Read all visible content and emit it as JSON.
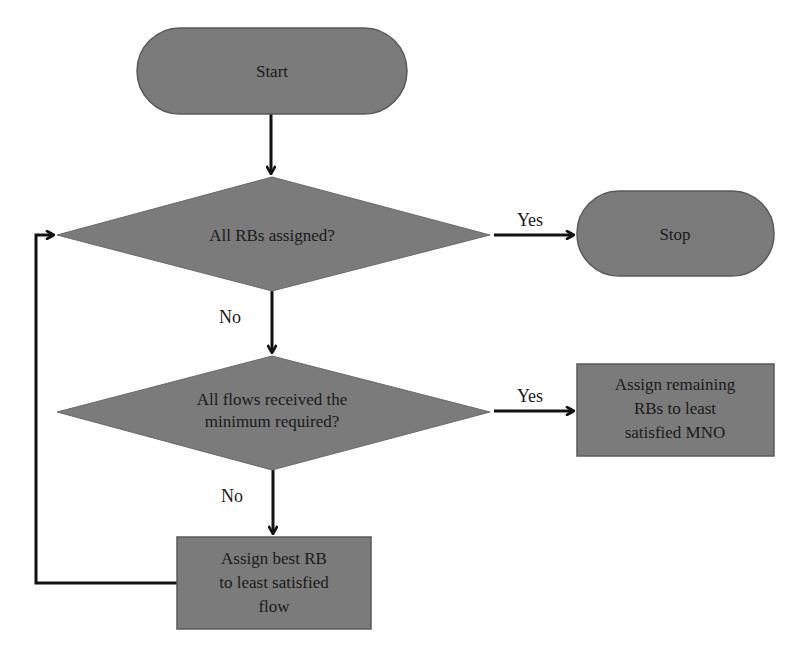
{
  "diagram": {
    "type": "flowchart",
    "colors": {
      "node_fill": "#7b7b7b",
      "node_border": "#5a5a5a",
      "edge": "#111111",
      "text": "#1a1a1a"
    },
    "nodes": {
      "start": {
        "shape": "terminator",
        "label": "Start"
      },
      "decision_rbs": {
        "shape": "decision",
        "label": "All RBs assigned?"
      },
      "stop": {
        "shape": "terminator",
        "label": "Stop"
      },
      "decision_flows": {
        "shape": "decision",
        "lines": [
          "All flows received the",
          "minimum required?"
        ]
      },
      "assign_remaining": {
        "shape": "process",
        "lines": [
          "Assign remaining",
          "RBs to least",
          "satisfied MNO"
        ]
      },
      "assign_best": {
        "shape": "process",
        "lines": [
          "Assign best RB",
          "to least satisfied",
          "flow"
        ]
      }
    },
    "edges": {
      "start_to_rbs": {
        "from": "start",
        "to": "decision_rbs",
        "label": ""
      },
      "rbs_yes": {
        "from": "decision_rbs",
        "to": "stop",
        "label": "Yes"
      },
      "rbs_no": {
        "from": "decision_rbs",
        "to": "decision_flows",
        "label": "No"
      },
      "flows_yes": {
        "from": "decision_flows",
        "to": "assign_remaining",
        "label": "Yes"
      },
      "flows_no": {
        "from": "decision_flows",
        "to": "assign_best",
        "label": "No"
      },
      "loop_back": {
        "from": "assign_best",
        "to": "decision_rbs",
        "label": ""
      }
    }
  }
}
